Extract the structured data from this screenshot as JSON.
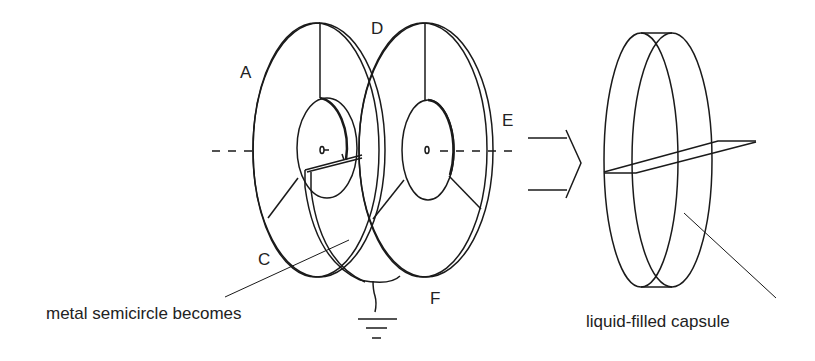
{
  "diagram": {
    "labels": {
      "A": "A",
      "C": "C",
      "D": "D",
      "E": "E",
      "F": "F"
    },
    "captions": {
      "left": "metal semicircle becomes",
      "right": "liquid-filled capsule"
    },
    "colors": {
      "stroke": "#1a1a1a",
      "background": "#ffffff"
    }
  }
}
